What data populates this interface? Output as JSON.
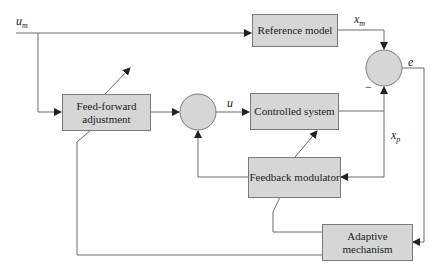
{
  "diagram": {
    "type": "block-diagram",
    "blocks": {
      "feed_forward": "Feed-forward adjustment",
      "reference_model": "Reference model",
      "controlled_system": "Controlled system",
      "feedback_modulator": "Feedback modulator",
      "adaptive_mechanism": "Adaptive mechanism"
    },
    "signals": {
      "input": "u",
      "input_sub": "m",
      "control": "u",
      "model_output": "x",
      "model_output_sub": "m",
      "plant_output": "x",
      "plant_output_sub": "p",
      "error": "e",
      "minus_sign": "−"
    },
    "summing_junctions": [
      "controller-sum",
      "error-sum"
    ],
    "colors": {
      "block_fill": "#d6d6d6",
      "line": "#555555"
    }
  }
}
